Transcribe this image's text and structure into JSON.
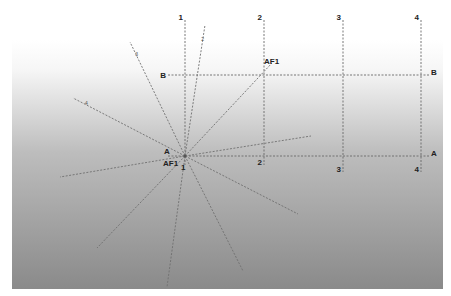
{
  "diagram": {
    "type": "structural-grid-with-radial-lines",
    "background": {
      "panel": {
        "x": 12,
        "y": 40,
        "width": 431,
        "height": 249
      },
      "gradient_top": "#ffffff",
      "gradient_mid": "#bdbdbd",
      "gradient_bottom": "#8a8a8a",
      "outer": "#ffffff"
    },
    "line_color": "#6a6a6a",
    "label_color": "#222222",
    "grid": {
      "vertical_axes": [
        {
          "id": "1",
          "x": 185,
          "y1": 20,
          "y2": 165,
          "top_label": "1",
          "bottom_label": "1"
        },
        {
          "id": "2",
          "x": 264,
          "y1": 20,
          "y2": 165,
          "top_label": "2",
          "bottom_label": "2"
        },
        {
          "id": "3",
          "x": 343,
          "y1": 20,
          "y2": 172,
          "top_label": "3",
          "bottom_label": "3"
        },
        {
          "id": "4",
          "x": 421,
          "y1": 20,
          "y2": 172,
          "top_label": "4",
          "bottom_label": "4"
        }
      ],
      "horizontal_axes": [
        {
          "id": "B",
          "y": 75,
          "x1": 168,
          "x2": 430,
          "left_label": "B",
          "right_label": "B"
        },
        {
          "id": "A",
          "y": 156,
          "x1": 168,
          "x2": 430,
          "left_label": "A",
          "right_label": "A"
        }
      ]
    },
    "hub": {
      "x": 185,
      "y": 156
    },
    "rays": [
      {
        "x": 205,
        "y": 25,
        "tag": "2"
      },
      {
        "x": 130,
        "y": 42,
        "tag": "3"
      },
      {
        "x": 73,
        "y": 98,
        "tag": "4"
      },
      {
        "x": 272,
        "y": 63,
        "tag": ""
      },
      {
        "x": 311,
        "y": 136,
        "tag": ""
      },
      {
        "x": 60,
        "y": 177,
        "tag": ""
      },
      {
        "x": 97,
        "y": 248,
        "tag": ""
      },
      {
        "x": 167,
        "y": 287,
        "tag": ""
      },
      {
        "x": 243,
        "y": 271,
        "tag": ""
      },
      {
        "x": 298,
        "y": 214,
        "tag": ""
      }
    ],
    "annotations": [
      {
        "id": "af1-top",
        "text": "AF1",
        "x": 264,
        "y": 64
      },
      {
        "id": "af1-hub",
        "text": "AF1",
        "x": 163,
        "y": 166
      },
      {
        "id": "hub-1",
        "text": "1",
        "x": 181,
        "y": 170
      },
      {
        "id": "hub-A",
        "text": "A",
        "x": 164,
        "y": 154
      }
    ]
  }
}
